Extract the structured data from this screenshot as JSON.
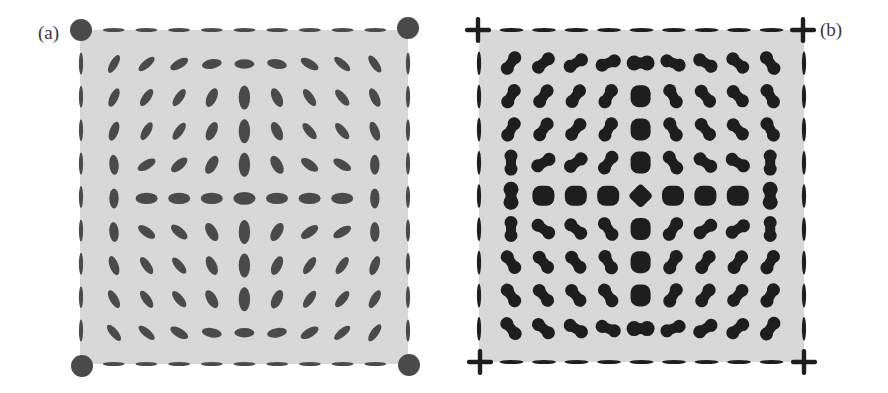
{
  "figure": {
    "panels": [
      {
        "id": "a",
        "label": "(a)"
      },
      {
        "id": "b",
        "label": "(b)"
      }
    ]
  },
  "colors": {
    "background": "#ffffff",
    "field": "#d9d9d9",
    "blob_a": "#4a4a4a",
    "blob_b": "#1e1e1e",
    "label": "#3a3a3a"
  },
  "chart_data": [
    {
      "type": "vector-field-glyph-grid",
      "title": "(a)",
      "glyph": "ellipse",
      "corner_marker": "filled-circle",
      "grid": {
        "rows": 9,
        "cols": 9
      },
      "angles_deg": [
        [
          -60,
          -40,
          -30,
          -10,
          0,
          10,
          30,
          40,
          55
        ],
        [
          -65,
          -55,
          -55,
          -65,
          90,
          65,
          55,
          50,
          65
        ],
        [
          -70,
          -60,
          -55,
          -65,
          90,
          65,
          50,
          50,
          70
        ],
        [
          85,
          -30,
          -40,
          -60,
          90,
          60,
          35,
          30,
          90
        ],
        [
          90,
          0,
          0,
          0,
          0,
          0,
          0,
          0,
          90
        ],
        [
          85,
          35,
          40,
          60,
          90,
          -60,
          -35,
          -30,
          90
        ],
        [
          70,
          55,
          50,
          65,
          90,
          -65,
          -55,
          -55,
          -70
        ],
        [
          60,
          55,
          50,
          60,
          90,
          -65,
          -55,
          -50,
          -60
        ],
        [
          50,
          40,
          30,
          10,
          0,
          -10,
          -30,
          -40,
          -55
        ]
      ],
      "major_axis_px": [
        [
          10,
          10,
          10,
          10,
          10,
          10,
          10,
          10,
          10
        ],
        [
          10,
          10,
          10,
          10,
          12,
          10,
          10,
          10,
          10
        ],
        [
          10,
          10,
          10,
          10,
          12,
          10,
          10,
          10,
          10
        ],
        [
          10,
          10,
          10,
          10,
          12,
          10,
          10,
          10,
          10
        ],
        [
          10,
          11,
          11,
          11,
          11,
          11,
          11,
          11,
          10
        ],
        [
          10,
          10,
          10,
          10,
          12,
          10,
          10,
          10,
          10
        ],
        [
          10,
          10,
          10,
          10,
          12,
          10,
          10,
          10,
          10
        ],
        [
          10,
          10,
          10,
          10,
          12,
          10,
          10,
          10,
          10
        ],
        [
          10,
          10,
          10,
          10,
          10,
          10,
          10,
          10,
          10
        ]
      ],
      "minor_axis_px": [
        [
          5.5,
          5.5,
          6.5,
          7,
          7,
          7,
          6.5,
          5.5,
          5.5
        ],
        [
          6,
          6,
          6,
          7.5,
          9,
          7.5,
          6,
          6,
          6.5
        ],
        [
          6.5,
          6,
          6,
          7.5,
          9,
          7.5,
          6,
          6,
          6.5
        ],
        [
          7,
          6.5,
          7,
          8,
          9,
          8,
          7,
          6.5,
          7
        ],
        [
          7,
          9,
          9,
          9,
          10.5,
          9,
          9,
          9,
          7
        ],
        [
          7,
          6.5,
          7,
          8,
          9,
          8,
          7,
          6.5,
          7
        ],
        [
          6.5,
          6,
          6,
          7.5,
          9,
          7.5,
          6,
          6,
          6.5
        ],
        [
          6,
          6,
          6,
          7.5,
          9,
          7.5,
          6,
          6,
          6
        ],
        [
          5.5,
          5.5,
          6.5,
          7,
          7,
          7,
          6.5,
          5.5,
          5.5
        ]
      ]
    },
    {
      "type": "vector-field-glyph-grid",
      "title": "(b)",
      "glyph": "dumbbell",
      "corner_marker": "plus-cross",
      "grid": {
        "rows": 9,
        "cols": 9
      },
      "angles_deg": [
        [
          -55,
          -40,
          -30,
          -20,
          0,
          20,
          30,
          40,
          55
        ],
        [
          -60,
          -55,
          -55,
          -60,
          90,
          60,
          50,
          45,
          60
        ],
        [
          -60,
          -55,
          -50,
          -60,
          90,
          60,
          50,
          45,
          60
        ],
        [
          90,
          -30,
          -35,
          -55,
          90,
          55,
          35,
          30,
          90
        ],
        [
          90,
          0,
          0,
          0,
          45,
          0,
          0,
          0,
          90
        ],
        [
          90,
          35,
          40,
          55,
          90,
          -55,
          -35,
          -30,
          90
        ],
        [
          55,
          50,
          50,
          60,
          90,
          -60,
          -55,
          -55,
          -60
        ],
        [
          55,
          50,
          50,
          55,
          90,
          -60,
          -55,
          -50,
          -60
        ],
        [
          50,
          40,
          30,
          20,
          0,
          -20,
          -30,
          -40,
          -55
        ]
      ]
    }
  ]
}
